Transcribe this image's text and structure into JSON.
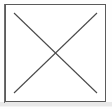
{
  "canvas": {
    "width": 112,
    "height": 109,
    "outer_background": "#fefefe",
    "under_strip_color": "#e9e9e9"
  },
  "frame": {
    "name": "image-placeholder-frame",
    "x": 5,
    "y": 4,
    "width": 101,
    "height": 98,
    "fill": "#ffffff",
    "border_color": "#5b5b5b",
    "border_width": 1,
    "shadow_color": "#6e6e6e"
  },
  "x_mark": {
    "name": "x-mark",
    "description": "broken-image / cross-out X drawn corner to corner inside the frame",
    "stroke_color": "#4a4a4a",
    "stroke_width": 1.1,
    "intersection": {
      "x": 56,
      "y": 53
    },
    "lines": [
      {
        "name": "diagonal-down-right",
        "x1": 14,
        "y1": 13,
        "x2": 97,
        "y2": 93
      },
      {
        "name": "diagonal-down-left",
        "x1": 97,
        "y1": 13,
        "x2": 14,
        "y2": 93
      }
    ]
  },
  "text": {
    "has_text": false,
    "labels": []
  }
}
